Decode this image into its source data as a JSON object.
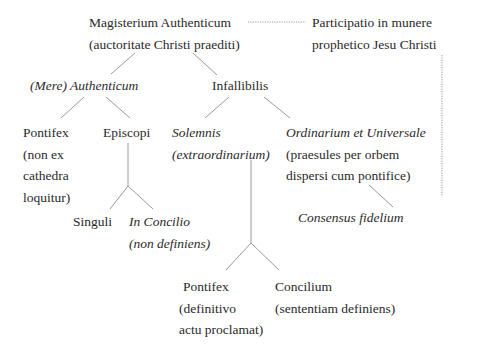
{
  "diagram": {
    "nodes": {
      "magisterium": {
        "line1": "Magisterium Authenticum",
        "line2": "(auctoritate Christi praediti)"
      },
      "participatio": {
        "line1": "Participatio in munere",
        "line2": "prophetico Jesu Christi"
      },
      "mere_authenticum": {
        "line1": "(Mere) Authenticum"
      },
      "infallibilis": {
        "line1": "Infallibilis"
      },
      "pontifex_non_ex": {
        "line1": "Pontifex",
        "line2": "(non ex",
        "line3": "cathedra",
        "line4": "loquitur)"
      },
      "episcopi": {
        "line1": "Episcopi"
      },
      "solemnis": {
        "line1": "Solemnis",
        "line2": "(extraordinarium)"
      },
      "ordinarium": {
        "line1": "Ordinarium et Universale",
        "line2": "(praesules per orbem",
        "line3": "dispersi cum pontifice)"
      },
      "singuli": {
        "line1": "Singuli"
      },
      "in_concilio": {
        "line1": "In Concilio",
        "line2": "(non definiens)"
      },
      "consensus": {
        "line1": "Consensus fidelium"
      },
      "pontifex_definitivo": {
        "line1": "Pontifex",
        "line2": "(definitivo",
        "line3": "actu proclamat)"
      },
      "concilium": {
        "line1": "Concilium",
        "line2": "(sententiam definiens)"
      }
    },
    "edges": [
      {
        "from": "magisterium",
        "to": "mere_authenticum",
        "style": "solid"
      },
      {
        "from": "magisterium",
        "to": "infallibilis",
        "style": "solid"
      },
      {
        "from": "magisterium",
        "to": "participatio",
        "style": "dotted"
      },
      {
        "from": "mere_authenticum",
        "to": "pontifex_non_ex",
        "style": "solid"
      },
      {
        "from": "mere_authenticum",
        "to": "episcopi",
        "style": "solid"
      },
      {
        "from": "infallibilis",
        "to": "solemnis",
        "style": "solid"
      },
      {
        "from": "infallibilis",
        "to": "ordinarium",
        "style": "solid"
      },
      {
        "from": "episcopi",
        "to": "singuli",
        "style": "solid"
      },
      {
        "from": "episcopi",
        "to": "in_concilio",
        "style": "solid"
      },
      {
        "from": "solemnis",
        "to": "pontifex_definitivo",
        "style": "solid"
      },
      {
        "from": "solemnis",
        "to": "concilium",
        "style": "solid"
      },
      {
        "from": "ordinarium",
        "to": "consensus",
        "style": "solid"
      },
      {
        "from": "participatio",
        "to": "consensus",
        "style": "dotted"
      }
    ],
    "colors": {
      "text": "#2a2a2a",
      "line": "#9a9a9a",
      "background": "#ffffff"
    }
  }
}
